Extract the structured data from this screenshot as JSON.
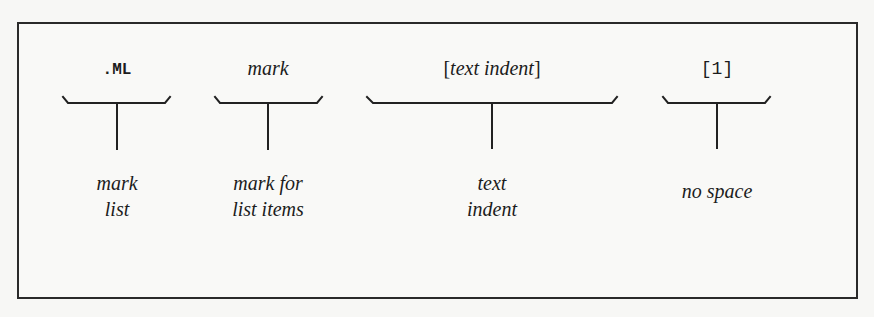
{
  "diagram": {
    "type": "macro-syntax-annotation",
    "parts": [
      {
        "id": "macro",
        "token": ".ML",
        "token_style": "bold-monospace",
        "description_lines": [
          "mark",
          "list"
        ]
      },
      {
        "id": "mark",
        "token": "mark",
        "token_style": "italic-serif",
        "description_lines": [
          "mark for",
          "list items"
        ]
      },
      {
        "id": "text-indent",
        "token_open": "[",
        "token": "text indent",
        "token_close": "]",
        "token_style": "italic-serif-bracketed",
        "description_lines": [
          "text",
          "indent"
        ]
      },
      {
        "id": "no-space",
        "token": "[1]",
        "token_style": "monospace",
        "description_lines": [
          "no space"
        ]
      }
    ],
    "colors": {
      "ink": "#1c1c1c",
      "border": "#2a2a2a",
      "background": "#f7f7f5"
    }
  }
}
